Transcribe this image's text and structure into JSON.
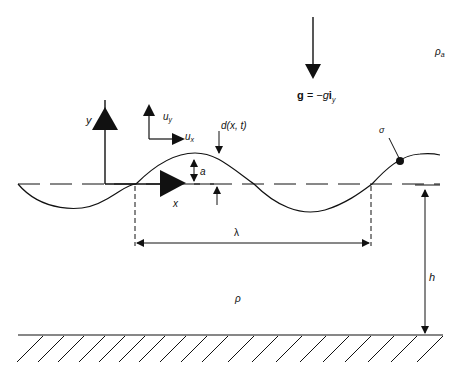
{
  "diagram": {
    "labels": {
      "rho_a": "ρ",
      "rho_a_sub": "a",
      "gravity_bold": "g",
      "gravity_rest": " = −g",
      "gravity_i": "i",
      "gravity_sub": "y",
      "sigma": "σ",
      "y_axis": "y",
      "x_axis": "x",
      "u_y": "u",
      "u_y_sub": "y",
      "u_x": "u",
      "u_x_sub": "x",
      "displacement": "d(x, t)",
      "amplitude": "a",
      "wavelength": "λ",
      "depth": "h",
      "rho": "ρ"
    },
    "colors": {
      "ink": "#111111",
      "background": "#ffffff"
    }
  }
}
